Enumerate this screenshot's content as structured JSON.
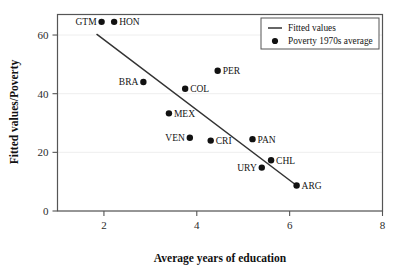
{
  "chart_data": {
    "type": "scatter",
    "title": "",
    "xlabel": "Average years of education",
    "ylabel": "Fitted values/Poverty",
    "xlim": [
      1.0,
      8.0
    ],
    "ylim": [
      0,
      67
    ],
    "xticks": [
      "2",
      "4",
      "6",
      "8"
    ],
    "xtick_values": [
      2,
      4,
      6,
      8
    ],
    "yticks": [
      "0",
      "20",
      "40",
      "60"
    ],
    "ytick_values": [
      0,
      20,
      40,
      60
    ],
    "grid": "horizontal-light",
    "legend_position": "top-right",
    "legend": [
      {
        "key": "fitted-values",
        "label": "Fitted values",
        "marker": "line"
      },
      {
        "key": "poverty-average",
        "label": "Poverty 1970s average",
        "marker": "dot"
      }
    ],
    "series": [
      {
        "name": "Poverty 1970s average",
        "marker": "dot",
        "color": "#111111",
        "points": [
          {
            "label": "GTM",
            "x": 1.95,
            "y": 64.5,
            "label_side": "left"
          },
          {
            "label": "HON",
            "x": 2.22,
            "y": 64.5,
            "label_side": "right"
          },
          {
            "label": "BRA",
            "x": 2.85,
            "y": 44.0,
            "label_side": "left"
          },
          {
            "label": "PER",
            "x": 4.45,
            "y": 47.8,
            "label_side": "right"
          },
          {
            "label": "COL",
            "x": 3.75,
            "y": 41.7,
            "label_side": "right"
          },
          {
            "label": "MEX",
            "x": 3.4,
            "y": 33.3,
            "label_side": "right"
          },
          {
            "label": "VEN",
            "x": 3.85,
            "y": 25.0,
            "label_side": "left"
          },
          {
            "label": "CRI",
            "x": 4.3,
            "y": 24.0,
            "label_side": "right"
          },
          {
            "label": "PAN",
            "x": 5.2,
            "y": 24.5,
            "label_side": "right"
          },
          {
            "label": "CHL",
            "x": 5.6,
            "y": 17.3,
            "label_side": "right"
          },
          {
            "label": "URY",
            "x": 5.4,
            "y": 14.8,
            "label_side": "left"
          },
          {
            "label": "ARG",
            "x": 6.15,
            "y": 8.7,
            "label_side": "right"
          }
        ]
      },
      {
        "name": "Fitted values",
        "marker": "line",
        "color": "#333333",
        "line": [
          {
            "x": 1.85,
            "y": 60.2
          },
          {
            "x": 6.15,
            "y": 8.7
          }
        ]
      }
    ]
  },
  "axis": {
    "x_title": "Average years of education",
    "y_title": "Fitted values/Poverty"
  },
  "colors": {
    "marker": "#111111",
    "line": "#333333",
    "frame": "#555555",
    "grid": "#eeeeee",
    "text": "#141414",
    "background": "#ffffff"
  }
}
